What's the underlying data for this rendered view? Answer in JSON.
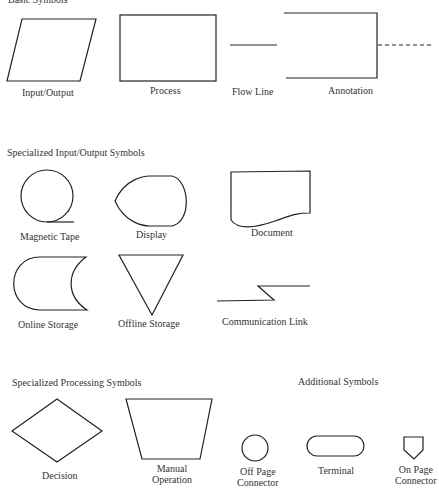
{
  "sections": {
    "basic": {
      "title": "Basic Symbols"
    },
    "specialized_io": {
      "title": "Specialized Input/Output Symbols"
    },
    "specialized_processing": {
      "title": "Specialized Processing Symbols"
    },
    "additional": {
      "title": "Additional Symbols"
    }
  },
  "symbols": {
    "input_output": "Input/Output",
    "process": "Process",
    "flow_line": "Flow Line",
    "annotation": "Annotation",
    "magnetic_tape": "Magnetic Tape",
    "display": "Display",
    "document": "Document",
    "online_storage": "Online Storage",
    "offline_storage": "Offline Storage",
    "communication_link": "Communication Link",
    "decision": "Decision",
    "manual_operation": "Manual\nOperation",
    "off_page_connector": "Off Page\nConnector",
    "terminal": "Terminal",
    "on_page_connector": "On Page\nConnector"
  },
  "colors": {
    "stroke": "#222222",
    "background": "#ffffff",
    "text": "#333333"
  }
}
